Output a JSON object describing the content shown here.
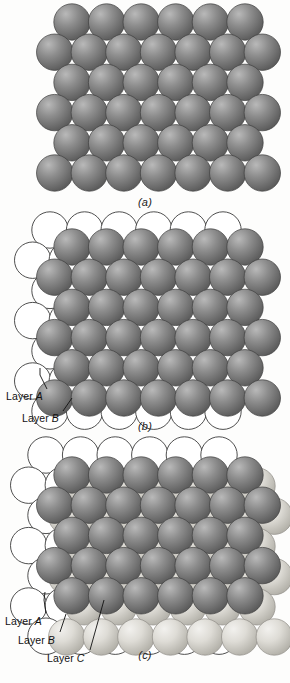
{
  "figure": {
    "background_color": "#fdfdfc",
    "width": 290,
    "height": 683
  },
  "colors": {
    "sphere_dark_light": "#b9b9b9",
    "sphere_dark_mid": "#8d8d8d",
    "sphere_dark_edge": "#585858",
    "sphere_light_light": "#f2f1ee",
    "sphere_light_mid": "#dedcd6",
    "sphere_light_edge": "#b0aea6",
    "outline_stroke": "#3b3b3b",
    "outline_fill": "#ffffff",
    "text": "#111111"
  },
  "panels": [
    {
      "id": "a",
      "caption": "(a)",
      "description": "Single close-packed plane of atoms, layer A",
      "layers": [
        "A"
      ],
      "rows": 6,
      "spheres_long_row": 7,
      "spheres_short_row": 6,
      "labels": []
    },
    {
      "id": "b",
      "caption": "(b)",
      "description": "Two close-packed planes, B layer atoms resting in A layer depressions",
      "layers": [
        "A",
        "B"
      ],
      "rows": 6,
      "spheres_long_row": 7,
      "spheres_short_row": 6,
      "labels": [
        {
          "name": "layer-a",
          "prefix": "Layer ",
          "letter": "A"
        },
        {
          "name": "layer-b",
          "prefix": "Layer ",
          "letter": "B"
        }
      ]
    },
    {
      "id": "c",
      "caption": "(c)",
      "description": "Three close-packed planes, ABC stacking sequence",
      "layers": [
        "A",
        "B",
        "C"
      ],
      "rows": 6,
      "spheres_long_row": 7,
      "spheres_short_row": 6,
      "labels": [
        {
          "name": "layer-a",
          "prefix": "Layer ",
          "letter": "A"
        },
        {
          "name": "layer-b",
          "prefix": "Layer ",
          "letter": "B"
        },
        {
          "name": "layer-c",
          "prefix": "Layer ",
          "letter": "C"
        }
      ]
    }
  ],
  "captions": {
    "a": "(a)",
    "b": "(b)",
    "c": "(c)"
  },
  "labels": {
    "layer_prefix": "Layer ",
    "a": "A",
    "b": "B",
    "c": "C"
  }
}
